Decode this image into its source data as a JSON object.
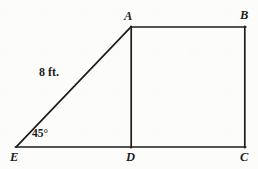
{
  "figure": {
    "kind": "geometry-diagram",
    "background_color": "#fcfcfb",
    "stroke_color": "#1c1c1c",
    "stroke_width": 1.6,
    "width": 258,
    "height": 169,
    "vertices": [
      {
        "id": "A",
        "label": "A",
        "x": 131,
        "y": 27,
        "label_x": 124,
        "label_y": 10
      },
      {
        "id": "B",
        "label": "B",
        "x": 245,
        "y": 27,
        "label_x": 240,
        "label_y": 9
      },
      {
        "id": "C",
        "label": "C",
        "x": 245,
        "y": 147,
        "label_x": 240,
        "label_y": 151
      },
      {
        "id": "D",
        "label": "D",
        "x": 131,
        "y": 147,
        "label_x": 126,
        "label_y": 151
      },
      {
        "id": "E",
        "label": "E",
        "x": 16,
        "y": 147,
        "label_x": 10,
        "label_y": 151
      }
    ],
    "segments": [
      {
        "id": "AB",
        "from": "A",
        "to": "B"
      },
      {
        "id": "BC",
        "from": "B",
        "to": "C"
      },
      {
        "id": "CD",
        "from": "C",
        "to": "D"
      },
      {
        "id": "AD",
        "from": "A",
        "to": "D"
      },
      {
        "id": "DE",
        "from": "D",
        "to": "E"
      },
      {
        "id": "EA",
        "from": "E",
        "to": "A"
      }
    ],
    "annotations": {
      "side_length": {
        "text": "8 ft.",
        "segment": "EA",
        "x": 39,
        "y": 66
      },
      "angle": {
        "text": "45°",
        "vertex": "E",
        "value": 45,
        "unit": "degrees",
        "x": 32,
        "y": 128
      }
    }
  }
}
